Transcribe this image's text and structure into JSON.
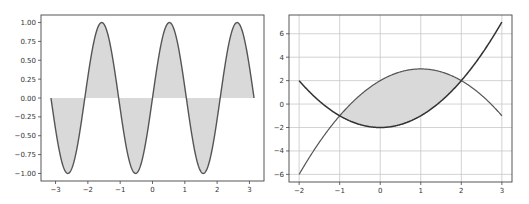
{
  "figure": {
    "width": 529,
    "height": 204,
    "background": "#ffffff"
  },
  "colors": {
    "line": "#555555",
    "line_dark": "#333333",
    "fill": "#d9d9d9",
    "grid": "#c8c8c8",
    "axes": "#444444",
    "text": "#333333"
  },
  "chart_data": [
    {
      "type": "area",
      "title": "",
      "xlabel": "",
      "ylabel": "",
      "function": "y = sin(3x)",
      "x_range": [
        -3.1416,
        3.1416
      ],
      "xlim": [
        -3.45,
        3.45
      ],
      "ylim": [
        -1.1,
        1.1
      ],
      "grid": false,
      "fill_between": "curve and y=0",
      "x_ticks": [
        "−3",
        "−2",
        "−1",
        "0",
        "1",
        "2",
        "3"
      ],
      "x_tick_values": [
        -3,
        -2,
        -1,
        0,
        1,
        2,
        3
      ],
      "y_ticks": [
        "1.00",
        "0.75",
        "0.50",
        "0.25",
        "0.00",
        "−0.25",
        "−0.50",
        "−0.75",
        "−1.00"
      ],
      "y_tick_values": [
        1.0,
        0.75,
        0.5,
        0.25,
        0.0,
        -0.25,
        -0.5,
        -0.75,
        -1.0
      ],
      "key_points": {
        "x": [
          -3.1416,
          -2.618,
          -2.0944,
          -1.5708,
          -1.0472,
          -0.5236,
          0,
          0.5236,
          1.0472,
          1.5708,
          2.0944,
          2.618,
          3.1416
        ],
        "y": [
          0,
          -1,
          0,
          1,
          0,
          -1,
          0,
          1,
          0,
          -1,
          0,
          1,
          0
        ]
      }
    },
    {
      "type": "line",
      "title": "",
      "xlabel": "",
      "ylabel": "",
      "grid": true,
      "xlim": [
        -2.25,
        3.25
      ],
      "ylim": [
        -6.65,
        7.6
      ],
      "series": [
        {
          "name": "y1 = x^2 - 2",
          "x": [
            -2,
            -1,
            0,
            1,
            2,
            3
          ],
          "values": [
            2,
            -1,
            -2,
            -1,
            2,
            7
          ]
        },
        {
          "name": "y2 = -x^2 + 2x + 2",
          "x": [
            -2,
            -1,
            0,
            1,
            2,
            3
          ],
          "values": [
            -6,
            -1,
            2,
            3,
            2,
            -1
          ]
        }
      ],
      "fill_between": {
        "x_range": [
          -1,
          2
        ],
        "between": [
          "y1",
          "y2"
        ]
      },
      "intersections": [
        [
          -1,
          -1
        ],
        [
          2,
          2
        ]
      ],
      "x_ticks": [
        "−2",
        "−1",
        "0",
        "1",
        "2",
        "3"
      ],
      "x_tick_values": [
        -2,
        -1,
        0,
        1,
        2,
        3
      ],
      "y_ticks": [
        "6",
        "4",
        "2",
        "0",
        "−2",
        "−4",
        "−6"
      ],
      "y_tick_values": [
        6,
        4,
        2,
        0,
        -2,
        -4,
        -6
      ]
    }
  ],
  "layout": {
    "left_axes": {
      "x0": 41,
      "y0": 15,
      "x1": 264,
      "y1": 181
    },
    "right_axes": {
      "x0": 289,
      "y0": 15,
      "x1": 512,
      "y1": 182
    }
  }
}
